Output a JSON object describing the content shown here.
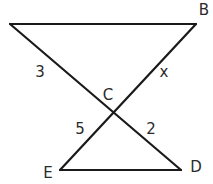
{
  "figure": {
    "type": "geometry-diagram",
    "stroke_color": "#1a1a1a",
    "background_color": "#ffffff"
  },
  "vertices": {
    "A": {
      "label": ""
    },
    "B": {
      "label": "B"
    },
    "C": {
      "label": "C"
    },
    "D": {
      "label": "D"
    },
    "E": {
      "label": "E"
    }
  },
  "segments": [
    {
      "id": "top",
      "from": "A",
      "to": "B",
      "length_label": ""
    },
    {
      "id": "AC",
      "from": "A",
      "to": "C",
      "length_label": "3"
    },
    {
      "id": "BC",
      "from": "B",
      "to": "C",
      "length_label": "x"
    },
    {
      "id": "EC",
      "from": "E",
      "to": "C",
      "length_label": "5"
    },
    {
      "id": "CD",
      "from": "C",
      "to": "D",
      "length_label": "2"
    },
    {
      "id": "ED",
      "from": "E",
      "to": "D",
      "length_label": ""
    }
  ],
  "labels": {
    "B": "B",
    "C": "C",
    "D": "D",
    "E": "E",
    "AC_length": "3",
    "BC_length": "x",
    "EC_length": "5",
    "CD_length": "2"
  }
}
